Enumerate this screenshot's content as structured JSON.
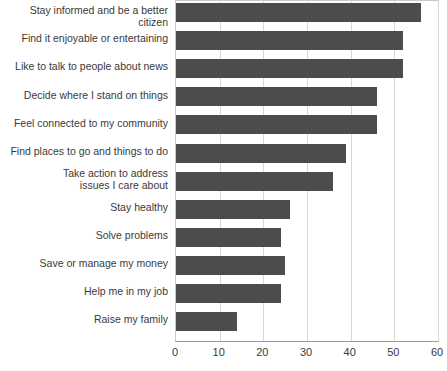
{
  "chart_data": {
    "type": "bar",
    "orientation": "horizontal",
    "title": "",
    "subtitle": "",
    "xlabel": "",
    "ylabel": "",
    "xlim": [
      0,
      60
    ],
    "xticks": [
      0,
      10,
      20,
      30,
      40,
      50,
      60
    ],
    "xtick_labels": [
      "0",
      "10",
      "20",
      "30",
      "40",
      "50",
      "60"
    ],
    "grid": true,
    "legend": null,
    "bar_color": "#4c4c4c",
    "categories": [
      "Stay informed and be a better citizen",
      "Find it enjoyable or entertaining",
      "Like to talk to people about news",
      "Decide where I stand on things",
      "Feel connected to my community",
      "Find places to go and things to do",
      "Take action to address\nissues I care about",
      "Stay healthy",
      "Solve problems",
      "Save or manage my money",
      "Help me in my job",
      "Raise my family"
    ],
    "values": [
      56,
      52,
      52,
      46,
      46,
      39,
      36,
      26,
      24,
      25,
      24,
      14
    ]
  }
}
